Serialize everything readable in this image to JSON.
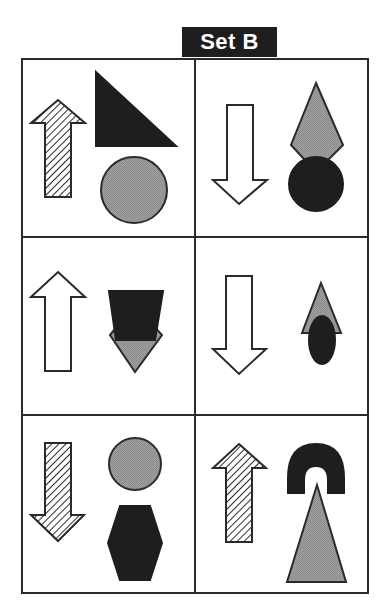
{
  "title": "Set B",
  "colors": {
    "black_fill": "#1e1e1e",
    "gray_fill": "#9a9a9a",
    "white_fill": "#ffffff",
    "stroke": "#2a2a2a",
    "hatch": "#2a2a2a"
  },
  "grid": {
    "rows": 3,
    "cols": 2
  },
  "cells": [
    {
      "position": "row1-col1",
      "arrow": {
        "direction": "up",
        "fill": "hatched"
      },
      "shapes": [
        {
          "type": "right-triangle",
          "fill": "black"
        },
        {
          "type": "circle",
          "fill": "gray"
        }
      ]
    },
    {
      "position": "row1-col2",
      "arrow": {
        "direction": "down",
        "fill": "white"
      },
      "shapes": [
        {
          "type": "diamond",
          "fill": "gray"
        },
        {
          "type": "circle",
          "fill": "black"
        }
      ]
    },
    {
      "position": "row2-col1",
      "arrow": {
        "direction": "up",
        "fill": "white"
      },
      "shapes": [
        {
          "type": "diamond",
          "fill": "gray"
        },
        {
          "type": "trapezoid",
          "fill": "black"
        }
      ]
    },
    {
      "position": "row2-col2",
      "arrow": {
        "direction": "down",
        "fill": "white"
      },
      "shapes": [
        {
          "type": "triangle",
          "fill": "gray"
        },
        {
          "type": "ellipse",
          "fill": "black"
        }
      ]
    },
    {
      "position": "row3-col1",
      "arrow": {
        "direction": "down",
        "fill": "hatched"
      },
      "shapes": [
        {
          "type": "circle",
          "fill": "gray"
        },
        {
          "type": "hexagon",
          "fill": "black"
        }
      ]
    },
    {
      "position": "row3-col2",
      "arrow": {
        "direction": "up",
        "fill": "hatched"
      },
      "shapes": [
        {
          "type": "arch",
          "fill": "black"
        },
        {
          "type": "triangle",
          "fill": "gray"
        }
      ]
    }
  ]
}
